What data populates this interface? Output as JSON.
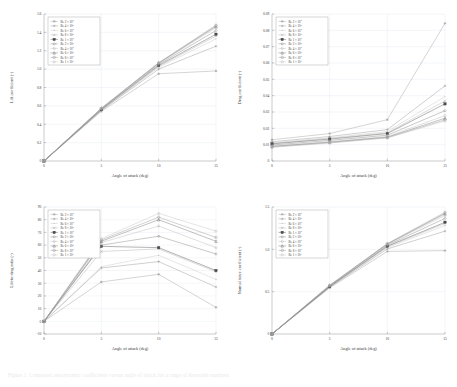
{
  "figure": {
    "caption": "Figure 1: Computed aerodynamic coefficients versus angle of attack for a range of Reynolds numbers.",
    "background": "#ffffff",
    "grid_color": "#dfe6ef",
    "axis_color": "#8e8e8e"
  },
  "legend_series": [
    {
      "label": "Re 2 × 10",
      "exp": "5",
      "marker": "asterisk",
      "color": "#9a9a9a"
    },
    {
      "label": "Re 4 × 10",
      "exp": "5",
      "marker": "plus",
      "color": "#8f8f8f"
    },
    {
      "label": "Re 6 × 10",
      "exp": "5",
      "marker": "dot",
      "color": "#c2c2c2"
    },
    {
      "label": "Re 8 × 10",
      "exp": "5",
      "marker": "cross",
      "color": "#a8a8a8"
    },
    {
      "label": "Re 1 × 10",
      "exp": "6",
      "marker": "square",
      "color": "#4a4a4a"
    },
    {
      "label": "Re 2 × 10",
      "exp": "6",
      "marker": "diamond",
      "color": "#7d7d7d"
    },
    {
      "label": "Re 4 × 10",
      "exp": "6",
      "marker": "star",
      "color": "#b5b5b5"
    },
    {
      "label": "Re 6 × 10",
      "exp": "6",
      "marker": "triangle",
      "color": "#6b6b6b"
    },
    {
      "label": "Re 8 × 10",
      "exp": "6",
      "marker": "circle",
      "color": "#909090"
    },
    {
      "label": "Re 1 × 10",
      "exp": "7",
      "marker": "pentagon",
      "color": "#bdbdbd"
    }
  ],
  "chart_data": [
    {
      "type": "line",
      "panel": "top-left",
      "title": "",
      "xlabel": "Angle of attack (deg)",
      "ylabel": "Lift coefficient (-)",
      "x": [
        0,
        5,
        10,
        15
      ],
      "xlim": [
        0,
        15
      ],
      "ylim": [
        0,
        1.6
      ],
      "xticks": [
        0,
        5,
        10,
        15
      ],
      "yticks": [
        0,
        0.2,
        0.4,
        0.6,
        0.8,
        1,
        1.2,
        1.4,
        1.6
      ],
      "grid": true,
      "legend_position": "upper-left",
      "series": [
        {
          "name": "Re 2 × 10^5",
          "values": [
            0,
            0.54,
            0.95,
            0.98
          ]
        },
        {
          "name": "Re 4 × 10^5",
          "values": [
            0,
            0.55,
            1.0,
            1.25
          ]
        },
        {
          "name": "Re 6 × 10^5",
          "values": [
            0,
            0.55,
            1.02,
            1.33
          ]
        },
        {
          "name": "Re 8 × 10^5",
          "values": [
            0,
            0.555,
            1.03,
            1.36
          ]
        },
        {
          "name": "Re 1 × 10^6",
          "values": [
            0,
            0.56,
            1.04,
            1.38
          ]
        },
        {
          "name": "Re 2 × 10^6",
          "values": [
            0,
            0.565,
            1.05,
            1.42
          ]
        },
        {
          "name": "Re 4 × 10^6",
          "values": [
            0,
            0.57,
            1.06,
            1.45
          ]
        },
        {
          "name": "Re 6 × 10^6",
          "values": [
            0,
            0.572,
            1.065,
            1.465
          ]
        },
        {
          "name": "Re 8 × 10^6",
          "values": [
            0,
            0.574,
            1.068,
            1.475
          ]
        },
        {
          "name": "Re 1 × 10^7",
          "values": [
            0,
            0.575,
            1.07,
            1.48
          ]
        }
      ]
    },
    {
      "type": "line",
      "panel": "top-right",
      "title": "",
      "xlabel": "Angle of attack (deg)",
      "ylabel": "Drag coefficient (-)",
      "x": [
        0,
        5,
        10,
        15
      ],
      "xlim": [
        0,
        15
      ],
      "ylim": [
        0,
        0.09
      ],
      "xticks": [
        0,
        5,
        10,
        15
      ],
      "yticks": [
        0,
        0.01,
        0.02,
        0.03,
        0.04,
        0.05,
        0.06,
        0.07,
        0.08,
        0.09
      ],
      "grid": true,
      "legend_position": "upper-left",
      "series": [
        {
          "name": "Re 2 × 10^5",
          "values": [
            0.013,
            0.0168,
            0.0253,
            0.0843
          ]
        },
        {
          "name": "Re 4 × 10^5",
          "values": [
            0.0118,
            0.015,
            0.0192,
            0.046
          ]
        },
        {
          "name": "Re 6 × 10^5",
          "values": [
            0.0112,
            0.0142,
            0.018,
            0.0395
          ]
        },
        {
          "name": "Re 8 × 10^5",
          "values": [
            0.0108,
            0.0138,
            0.0172,
            0.0368
          ]
        },
        {
          "name": "Re 1 × 10^6",
          "values": [
            0.0105,
            0.0134,
            0.0168,
            0.035
          ]
        },
        {
          "name": "Re 2 × 10^6",
          "values": [
            0.0098,
            0.0126,
            0.0158,
            0.0308
          ]
        },
        {
          "name": "Re 4 × 10^6",
          "values": [
            0.0092,
            0.0119,
            0.015,
            0.0278
          ]
        },
        {
          "name": "Re 6 × 10^6",
          "values": [
            0.0089,
            0.0115,
            0.0146,
            0.0262
          ]
        },
        {
          "name": "Re 8 × 10^6",
          "values": [
            0.0086,
            0.0112,
            0.0143,
            0.0252
          ]
        },
        {
          "name": "Re 1 × 10^7",
          "values": [
            0.0084,
            0.011,
            0.0141,
            0.0245
          ]
        }
      ]
    },
    {
      "type": "line",
      "panel": "bottom-left",
      "title": "",
      "xlabel": "Angle of attack (deg)",
      "ylabel": "Lift-to-drag ratio (-)",
      "x": [
        0,
        5,
        10,
        15
      ],
      "xlim": [
        0,
        15
      ],
      "ylim": [
        -10,
        90
      ],
      "xticks": [
        0,
        5,
        10,
        15
      ],
      "yticks": [
        -10,
        0,
        10,
        20,
        30,
        40,
        50,
        60,
        70,
        80,
        90
      ],
      "grid": true,
      "legend_position": "upper-left",
      "series": [
        {
          "name": "Re 2 × 10^5",
          "values": [
            0,
            31,
            37,
            11
          ]
        },
        {
          "name": "Re 4 × 10^5",
          "values": [
            0,
            42,
            47,
            27
          ]
        },
        {
          "name": "Re 6 × 10^5",
          "values": [
            0,
            43,
            52,
            33
          ]
        },
        {
          "name": "Re 8 × 10^5",
          "values": [
            0,
            55,
            57,
            39
          ]
        },
        {
          "name": "Re 1 × 10^6",
          "values": [
            0,
            59,
            58,
            40
          ]
        },
        {
          "name": "Re 2 × 10^6",
          "values": [
            0,
            60,
            67,
            53
          ]
        },
        {
          "name": "Re 4 × 10^6",
          "values": [
            0,
            62,
            75,
            58
          ]
        },
        {
          "name": "Re 6 × 10^6",
          "values": [
            0,
            63,
            80,
            63
          ]
        },
        {
          "name": "Re 8 × 10^6",
          "values": [
            0,
            64,
            82,
            66
          ]
        },
        {
          "name": "Re 1 × 10^7",
          "values": [
            0,
            65,
            85,
            71
          ]
        }
      ]
    },
    {
      "type": "line",
      "panel": "bottom-right",
      "title": "",
      "xlabel": "Angle of attack (deg)",
      "ylabel": "Normal force coefficient (-)",
      "x": [
        0,
        5,
        10,
        15
      ],
      "xlim": [
        0,
        15
      ],
      "ylim": [
        0,
        1.5
      ],
      "xticks": [
        0,
        5,
        10,
        15
      ],
      "yticks": [
        0,
        0.5,
        1,
        1.5
      ],
      "grid": true,
      "legend_position": "upper-left",
      "series": [
        {
          "name": "Re 2 × 10^5",
          "values": [
            0,
            0.545,
            0.975,
            0.985
          ]
        },
        {
          "name": "Re 4 × 10^5",
          "values": [
            0,
            0.552,
            1.005,
            1.215
          ]
        },
        {
          "name": "Re 6 × 10^5",
          "values": [
            0,
            0.555,
            1.02,
            1.28
          ]
        },
        {
          "name": "Re 8 × 10^5",
          "values": [
            0,
            0.558,
            1.03,
            1.305
          ]
        },
        {
          "name": "Re 1 × 10^6",
          "values": [
            0,
            0.56,
            1.038,
            1.32
          ]
        },
        {
          "name": "Re 2 × 10^6",
          "values": [
            0,
            0.566,
            1.048,
            1.365
          ]
        },
        {
          "name": "Re 4 × 10^6",
          "values": [
            0,
            0.57,
            1.058,
            1.4
          ]
        },
        {
          "name": "Re 6 × 10^6",
          "values": [
            0,
            0.573,
            1.063,
            1.42
          ]
        },
        {
          "name": "Re 8 × 10^6",
          "values": [
            0,
            0.575,
            1.066,
            1.432
          ]
        },
        {
          "name": "Re 1 × 10^7",
          "values": [
            0,
            0.576,
            1.068,
            1.44
          ]
        }
      ]
    }
  ]
}
